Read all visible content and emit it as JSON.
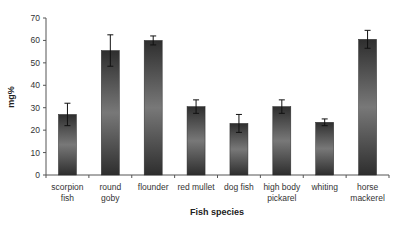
{
  "chart_data": {
    "type": "bar",
    "title": "",
    "xlabel": "Fish species",
    "ylabel": "mg%",
    "ylim": [
      0,
      70
    ],
    "yticks": [
      0,
      10,
      20,
      30,
      40,
      50,
      60,
      70
    ],
    "grid": false,
    "legend": null,
    "categories": [
      [
        "scorpion",
        "fish"
      ],
      [
        "round",
        "goby"
      ],
      [
        "flounder"
      ],
      [
        "red mullet"
      ],
      [
        "dog fish"
      ],
      [
        "high body",
        "pickarel"
      ],
      [
        "whiting"
      ],
      [
        "horse",
        "mackerel"
      ]
    ],
    "category_names": [
      "scorpion fish",
      "round goby",
      "flounder",
      "red mullet",
      "dog fish",
      "high body pickarel",
      "whiting",
      "horse mackerel"
    ],
    "values": [
      27,
      55.5,
      60,
      30.5,
      23,
      30.5,
      23.5,
      60.5
    ],
    "errors": [
      5,
      7,
      2,
      3,
      4,
      3,
      1.5,
      4
    ],
    "bar_style": "vertical gradient dark-light-dark gray with error bars"
  },
  "colors": {
    "bar_dark": "#2e2e2e",
    "bar_light": "#7a7a7a",
    "axis": "#555555"
  }
}
